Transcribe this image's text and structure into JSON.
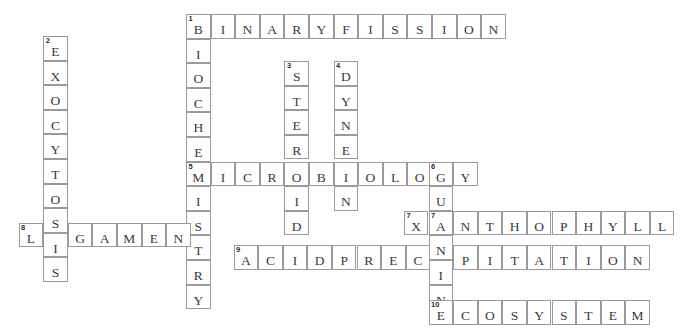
{
  "puzzle": {
    "title": "Biology Crossword Grid",
    "cell_size": 24.6,
    "origin_x": 186,
    "origin_y": 14,
    "grid_color": "#9a9a9a",
    "letter_color": "#3a3a3a",
    "background": "#ffffff",
    "entries": [
      {
        "number": "1",
        "direction": "across",
        "answer": "BINARYFISSION",
        "length": 13,
        "col": 0,
        "row": 0
      },
      {
        "number": "1",
        "direction": "down",
        "answer": "BIOCHEMISTRY",
        "length": 12,
        "col": 0,
        "row": 0
      },
      {
        "number": "2",
        "direction": "down",
        "answer": "EXOCYTOSIS",
        "length": 10,
        "col": -5.8,
        "row": 0.9
      },
      {
        "number": "3",
        "direction": "down",
        "answer": "STEROID",
        "length": 7,
        "col": 4,
        "row": 1.9
      },
      {
        "number": "4",
        "direction": "down",
        "answer": "DYNEIN",
        "length": 6,
        "col": 6,
        "row": 1.9
      },
      {
        "number": "5",
        "direction": "across",
        "answer": "MICROBIOLOGY",
        "length": 12,
        "col": 0,
        "row": 5.9
      },
      {
        "number": "6",
        "direction": "down",
        "answer": "GUANINE",
        "length": 7,
        "col": 9.85,
        "row": 5.9
      },
      {
        "number": "7",
        "direction": "across",
        "answer": "XANTHOPHYLL",
        "length": 11,
        "col": 8.85,
        "row": 7.9
      },
      {
        "number": "8",
        "direction": "across",
        "answer": "LIGAMENT",
        "length": 8,
        "col": -6.8,
        "row": 8.5
      },
      {
        "number": "9",
        "direction": "across",
        "answer": "ACIDPRECIPITATION",
        "length": 17,
        "col": 1.95,
        "row": 9.4
      },
      {
        "number": "10",
        "direction": "across",
        "answer": "ECOSYSTEM",
        "length": 9,
        "col": 9.85,
        "row": 11.4
      }
    ],
    "cells": [
      {
        "x": 186,
        "y": 14,
        "letter": "B",
        "number": "1"
      },
      {
        "x": 210.6,
        "y": 14,
        "letter": "I",
        "number": ""
      },
      {
        "x": 235.2,
        "y": 14,
        "letter": "N",
        "number": ""
      },
      {
        "x": 259.8,
        "y": 14,
        "letter": "A",
        "number": ""
      },
      {
        "x": 284.4,
        "y": 14,
        "letter": "R",
        "number": ""
      },
      {
        "x": 309.0,
        "y": 14,
        "letter": "Y",
        "number": ""
      },
      {
        "x": 333.6,
        "y": 14,
        "letter": "F",
        "number": ""
      },
      {
        "x": 358.2,
        "y": 14,
        "letter": "I",
        "number": ""
      },
      {
        "x": 382.8,
        "y": 14,
        "letter": "S",
        "number": ""
      },
      {
        "x": 407.4,
        "y": 14,
        "letter": "S",
        "number": ""
      },
      {
        "x": 432.0,
        "y": 14,
        "letter": "I",
        "number": ""
      },
      {
        "x": 456.6,
        "y": 14,
        "letter": "O",
        "number": ""
      },
      {
        "x": 481.2,
        "y": 14,
        "letter": "N",
        "number": ""
      },
      {
        "x": 186,
        "y": 38.6,
        "letter": "I",
        "number": ""
      },
      {
        "x": 186,
        "y": 63.2,
        "letter": "O",
        "number": ""
      },
      {
        "x": 186,
        "y": 87.8,
        "letter": "C",
        "number": ""
      },
      {
        "x": 186,
        "y": 112.4,
        "letter": "H",
        "number": ""
      },
      {
        "x": 186,
        "y": 137.0,
        "letter": "E",
        "number": ""
      },
      {
        "x": 186,
        "y": 161.6,
        "letter": "M",
        "number": "5"
      },
      {
        "x": 186,
        "y": 186.2,
        "letter": "I",
        "number": ""
      },
      {
        "x": 186,
        "y": 210.8,
        "letter": "S",
        "number": ""
      },
      {
        "x": 186,
        "y": 235.4,
        "letter": "T",
        "number": ""
      },
      {
        "x": 186,
        "y": 260.0,
        "letter": "R",
        "number": ""
      },
      {
        "x": 186,
        "y": 284.6,
        "letter": "Y",
        "number": ""
      },
      {
        "x": 43.2,
        "y": 36,
        "letter": "E",
        "number": "2"
      },
      {
        "x": 43.2,
        "y": 60.6,
        "letter": "X",
        "number": ""
      },
      {
        "x": 43.2,
        "y": 85.2,
        "letter": "O",
        "number": ""
      },
      {
        "x": 43.2,
        "y": 109.8,
        "letter": "C",
        "number": ""
      },
      {
        "x": 43.2,
        "y": 134.4,
        "letter": "Y",
        "number": ""
      },
      {
        "x": 43.2,
        "y": 159.0,
        "letter": "T",
        "number": ""
      },
      {
        "x": 43.2,
        "y": 183.6,
        "letter": "O",
        "number": ""
      },
      {
        "x": 43.2,
        "y": 208.2,
        "letter": "S",
        "number": ""
      },
      {
        "x": 43.2,
        "y": 232.8,
        "letter": "I",
        "number": ""
      },
      {
        "x": 43.2,
        "y": 257.4,
        "letter": "S",
        "number": ""
      },
      {
        "x": 284.4,
        "y": 61,
        "letter": "S",
        "number": "3"
      },
      {
        "x": 284.4,
        "y": 85.6,
        "letter": "T",
        "number": ""
      },
      {
        "x": 284.4,
        "y": 110.2,
        "letter": "E",
        "number": ""
      },
      {
        "x": 284.4,
        "y": 134.8,
        "letter": "R",
        "number": ""
      },
      {
        "x": 284.4,
        "y": 161.6,
        "letter": "O",
        "number": ""
      },
      {
        "x": 284.4,
        "y": 186.2,
        "letter": "I",
        "number": ""
      },
      {
        "x": 284.4,
        "y": 210.8,
        "letter": "D",
        "number": ""
      },
      {
        "x": 333.6,
        "y": 61,
        "letter": "D",
        "number": "4"
      },
      {
        "x": 333.6,
        "y": 85.6,
        "letter": "Y",
        "number": ""
      },
      {
        "x": 333.6,
        "y": 110.2,
        "letter": "N",
        "number": ""
      },
      {
        "x": 333.6,
        "y": 134.8,
        "letter": "E",
        "number": ""
      },
      {
        "x": 333.6,
        "y": 161.6,
        "letter": "I",
        "number": ""
      },
      {
        "x": 333.6,
        "y": 186.2,
        "letter": "N",
        "number": ""
      },
      {
        "x": 210.6,
        "y": 161.6,
        "letter": "I",
        "number": ""
      },
      {
        "x": 235.2,
        "y": 161.6,
        "letter": "C",
        "number": ""
      },
      {
        "x": 259.8,
        "y": 161.6,
        "letter": "R",
        "number": ""
      },
      {
        "x": 309.0,
        "y": 161.6,
        "letter": "B",
        "number": ""
      },
      {
        "x": 358.2,
        "y": 161.6,
        "letter": "O",
        "number": ""
      },
      {
        "x": 382.8,
        "y": 161.6,
        "letter": "L",
        "number": ""
      },
      {
        "x": 407.4,
        "y": 161.6,
        "letter": "O",
        "number": ""
      },
      {
        "x": 428.5,
        "y": 161.6,
        "letter": "G",
        "number": "6"
      },
      {
        "x": 453.1,
        "y": 161.6,
        "letter": "Y",
        "number": ""
      },
      {
        "x": 428.5,
        "y": 186.2,
        "letter": "U",
        "number": ""
      },
      {
        "x": 428.5,
        "y": 210.8,
        "letter": "A",
        "number": "7"
      },
      {
        "x": 428.5,
        "y": 235.4,
        "letter": "N",
        "number": ""
      },
      {
        "x": 428.5,
        "y": 260.0,
        "letter": "I",
        "number": ""
      },
      {
        "x": 428.5,
        "y": 284.6,
        "letter": "N",
        "number": ""
      },
      {
        "x": 428.5,
        "y": 300.0,
        "letter": "E",
        "number": "10"
      },
      {
        "x": 403.9,
        "y": 210.8,
        "letter": "X",
        "number": "7"
      },
      {
        "x": 453.1,
        "y": 210.8,
        "letter": "N",
        "number": ""
      },
      {
        "x": 477.7,
        "y": 210.8,
        "letter": "T",
        "number": ""
      },
      {
        "x": 502.3,
        "y": 210.8,
        "letter": "H",
        "number": ""
      },
      {
        "x": 526.9,
        "y": 210.8,
        "letter": "O",
        "number": ""
      },
      {
        "x": 551.5,
        "y": 210.8,
        "letter": "P",
        "number": ""
      },
      {
        "x": 576.1,
        "y": 210.8,
        "letter": "H",
        "number": ""
      },
      {
        "x": 600.7,
        "y": 210.8,
        "letter": "Y",
        "number": ""
      },
      {
        "x": 625.3,
        "y": 210.8,
        "letter": "L",
        "number": ""
      },
      {
        "x": 649.9,
        "y": 210.8,
        "letter": "L",
        "number": ""
      },
      {
        "x": 18.6,
        "y": 222.6,
        "letter": "L",
        "number": "8"
      },
      {
        "x": 67.8,
        "y": 222.6,
        "letter": "G",
        "number": ""
      },
      {
        "x": 92.4,
        "y": 222.6,
        "letter": "A",
        "number": ""
      },
      {
        "x": 117.0,
        "y": 222.6,
        "letter": "M",
        "number": ""
      },
      {
        "x": 141.6,
        "y": 222.6,
        "letter": "E",
        "number": ""
      },
      {
        "x": 166.2,
        "y": 222.6,
        "letter": "N",
        "number": ""
      },
      {
        "x": 233.5,
        "y": 245.0,
        "letter": "A",
        "number": "9"
      },
      {
        "x": 258.1,
        "y": 245.0,
        "letter": "C",
        "number": ""
      },
      {
        "x": 282.7,
        "y": 245.0,
        "letter": "I",
        "number": ""
      },
      {
        "x": 307.3,
        "y": 245.0,
        "letter": "D",
        "number": ""
      },
      {
        "x": 331.9,
        "y": 245.0,
        "letter": "P",
        "number": ""
      },
      {
        "x": 356.5,
        "y": 245.0,
        "letter": "R",
        "number": ""
      },
      {
        "x": 381.1,
        "y": 245.0,
        "letter": "E",
        "number": ""
      },
      {
        "x": 405.7,
        "y": 245.0,
        "letter": "C",
        "number": ""
      },
      {
        "x": 453.1,
        "y": 245.0,
        "letter": "P",
        "number": ""
      },
      {
        "x": 477.7,
        "y": 245.0,
        "letter": "I",
        "number": ""
      },
      {
        "x": 502.3,
        "y": 245.0,
        "letter": "T",
        "number": ""
      },
      {
        "x": 526.9,
        "y": 245.0,
        "letter": "A",
        "number": ""
      },
      {
        "x": 551.5,
        "y": 245.0,
        "letter": "T",
        "number": ""
      },
      {
        "x": 576.1,
        "y": 245.0,
        "letter": "I",
        "number": ""
      },
      {
        "x": 600.7,
        "y": 245.0,
        "letter": "O",
        "number": ""
      },
      {
        "x": 625.3,
        "y": 245.0,
        "letter": "N",
        "number": ""
      },
      {
        "x": 453.1,
        "y": 300.0,
        "letter": "C",
        "number": ""
      },
      {
        "x": 477.7,
        "y": 300.0,
        "letter": "O",
        "number": ""
      },
      {
        "x": 502.3,
        "y": 300.0,
        "letter": "S",
        "number": ""
      },
      {
        "x": 526.9,
        "y": 300.0,
        "letter": "Y",
        "number": ""
      },
      {
        "x": 551.5,
        "y": 300.0,
        "letter": "S",
        "number": ""
      },
      {
        "x": 576.1,
        "y": 300.0,
        "letter": "T",
        "number": ""
      },
      {
        "x": 600.7,
        "y": 300.0,
        "letter": "E",
        "number": ""
      },
      {
        "x": 625.3,
        "y": 300.0,
        "letter": "M",
        "number": ""
      }
    ]
  }
}
